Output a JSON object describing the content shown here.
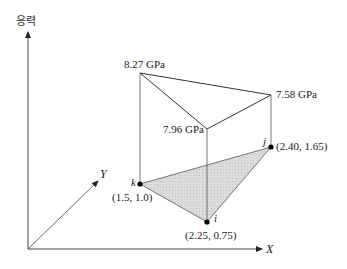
{
  "figure": {
    "type": "3d-stress-element-diagram",
    "axes": {
      "vertical_label": "응력",
      "x_label": "X",
      "y_label": "Y"
    },
    "nodes": [
      {
        "id": "i",
        "label": "i",
        "coords_text": "(2.25, 0.75)",
        "x": 2.25,
        "y": 0.75,
        "stress_text": "7.96 GPa",
        "stress": 7.96
      },
      {
        "id": "j",
        "label": "j",
        "coords_text": "(2.40, 1.65)",
        "x": 2.4,
        "y": 1.65,
        "stress_text": "7.58 GPa",
        "stress": 7.58
      },
      {
        "id": "k",
        "label": "k",
        "coords_text": "(1.5, 1.0)",
        "x": 1.5,
        "y": 1.0,
        "stress_text": "8.27 GPa",
        "stress": 8.27
      }
    ],
    "colors": {
      "line": "#333333",
      "fill": "#d9d9d9",
      "point": "#000000"
    }
  }
}
